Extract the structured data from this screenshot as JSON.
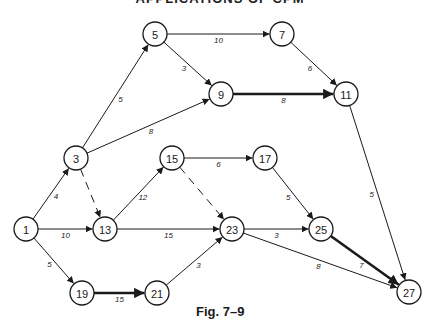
{
  "header": {
    "text": "APPLICATIONS OF CPM"
  },
  "caption": {
    "text": "Fig. 7–9"
  },
  "diagram": {
    "type": "activity-network",
    "node_radius": 12,
    "nodes": [
      {
        "id": "1",
        "label": "1",
        "x": 26,
        "y": 229
      },
      {
        "id": "3",
        "label": "3",
        "x": 76,
        "y": 158
      },
      {
        "id": "5",
        "label": "5",
        "x": 155,
        "y": 34
      },
      {
        "id": "7",
        "label": "7",
        "x": 282,
        "y": 34
      },
      {
        "id": "9",
        "label": "9",
        "x": 221,
        "y": 94
      },
      {
        "id": "11",
        "label": "11",
        "x": 346,
        "y": 94
      },
      {
        "id": "13",
        "label": "13",
        "x": 105,
        "y": 229
      },
      {
        "id": "15",
        "label": "15",
        "x": 172,
        "y": 158
      },
      {
        "id": "17",
        "label": "17",
        "x": 265,
        "y": 158
      },
      {
        "id": "19",
        "label": "19",
        "x": 82,
        "y": 293
      },
      {
        "id": "21",
        "label": "21",
        "x": 157,
        "y": 293
      },
      {
        "id": "23",
        "label": "23",
        "x": 232,
        "y": 229
      },
      {
        "id": "25",
        "label": "25",
        "x": 321,
        "y": 229
      },
      {
        "id": "27",
        "label": "27",
        "x": 409,
        "y": 292
      }
    ],
    "edges": [
      {
        "from": "1",
        "to": "3",
        "label": "4",
        "style": "solid"
      },
      {
        "from": "1",
        "to": "13",
        "label": "10",
        "style": "solid"
      },
      {
        "from": "1",
        "to": "19",
        "label": "5",
        "style": "solid"
      },
      {
        "from": "3",
        "to": "5",
        "label": "5",
        "style": "solid"
      },
      {
        "from": "3",
        "to": "9",
        "label": "8",
        "style": "solid"
      },
      {
        "from": "3",
        "to": "13",
        "label": "",
        "style": "dashed"
      },
      {
        "from": "5",
        "to": "7",
        "label": "10",
        "style": "solid"
      },
      {
        "from": "5",
        "to": "9",
        "label": "3",
        "style": "solid"
      },
      {
        "from": "7",
        "to": "11",
        "label": "6",
        "style": "solid"
      },
      {
        "from": "9",
        "to": "11",
        "label": "8",
        "style": "bold"
      },
      {
        "from": "11",
        "to": "27",
        "label": "5",
        "style": "solid"
      },
      {
        "from": "13",
        "to": "15",
        "label": "12",
        "style": "solid"
      },
      {
        "from": "13",
        "to": "23",
        "label": "15",
        "style": "solid"
      },
      {
        "from": "15",
        "to": "17",
        "label": "6",
        "style": "solid"
      },
      {
        "from": "15",
        "to": "23",
        "label": "",
        "style": "dashed"
      },
      {
        "from": "17",
        "to": "25",
        "label": "5",
        "style": "solid"
      },
      {
        "from": "19",
        "to": "21",
        "label": "15",
        "style": "bold"
      },
      {
        "from": "21",
        "to": "23",
        "label": "3",
        "style": "solid"
      },
      {
        "from": "23",
        "to": "25",
        "label": "3",
        "style": "solid"
      },
      {
        "from": "23",
        "to": "27",
        "label": "8",
        "style": "solid"
      },
      {
        "from": "25",
        "to": "27",
        "label": "7",
        "style": "bold"
      }
    ]
  }
}
